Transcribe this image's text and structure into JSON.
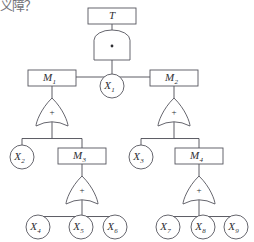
{
  "page": {
    "margin_text": "义障？",
    "background_color": "#ffffff",
    "line_color": "#55555d",
    "text_color": "#2e2e33"
  },
  "diagram": {
    "type": "fault-tree",
    "gate_symbols": {
      "and": "·",
      "or": "+"
    },
    "nodes": [
      {
        "id": "T",
        "kind": "box",
        "label": "T",
        "sub": "",
        "cx": 112,
        "cy": 16,
        "w": 48,
        "h": 16
      },
      {
        "id": "M1",
        "kind": "box",
        "label": "M",
        "sub": "1",
        "cx": 52,
        "cy": 78,
        "w": 48,
        "h": 16
      },
      {
        "id": "M2",
        "kind": "box",
        "label": "M",
        "sub": "2",
        "cx": 174,
        "cy": 78,
        "w": 48,
        "h": 16
      },
      {
        "id": "M3",
        "kind": "box",
        "label": "M",
        "sub": "3",
        "cx": 82,
        "cy": 156,
        "w": 48,
        "h": 16
      },
      {
        "id": "M4",
        "kind": "box",
        "label": "M",
        "sub": "4",
        "cx": 199,
        "cy": 156,
        "w": 48,
        "h": 16
      },
      {
        "id": "X1",
        "kind": "circle",
        "label": "X",
        "sub": "1",
        "cx": 112,
        "cy": 86,
        "r": 12
      },
      {
        "id": "X2",
        "kind": "circle",
        "label": "X",
        "sub": "2",
        "cx": 22,
        "cy": 157,
        "r": 12
      },
      {
        "id": "X3",
        "kind": "circle",
        "label": "X",
        "sub": "3",
        "cx": 141,
        "cy": 157,
        "r": 12
      },
      {
        "id": "X4",
        "kind": "circle",
        "label": "X",
        "sub": "4",
        "cx": 38,
        "cy": 227,
        "r": 12
      },
      {
        "id": "X5",
        "kind": "circle",
        "label": "X",
        "sub": "5",
        "cx": 81,
        "cy": 227,
        "r": 12
      },
      {
        "id": "X6",
        "kind": "circle",
        "label": "X",
        "sub": "6",
        "cx": 115,
        "cy": 227,
        "r": 12
      },
      {
        "id": "X7",
        "kind": "circle",
        "label": "X",
        "sub": "7",
        "cx": 168,
        "cy": 227,
        "r": 12
      },
      {
        "id": "X8",
        "kind": "circle",
        "label": "X",
        "sub": "8",
        "cx": 203,
        "cy": 227,
        "r": 12
      },
      {
        "id": "X9",
        "kind": "circle",
        "label": "X",
        "sub": "9",
        "cx": 236,
        "cy": 227,
        "r": 12
      }
    ],
    "gates": [
      {
        "id": "G0",
        "type": "and",
        "symbol": "·",
        "parent": "T",
        "cx": 112,
        "cy": 45,
        "children": [
          "M1",
          "X1",
          "M2"
        ]
      },
      {
        "id": "G1",
        "type": "or",
        "symbol": "+",
        "parent": "M1",
        "cx": 52,
        "cy": 112,
        "children": [
          "X2",
          "M3"
        ]
      },
      {
        "id": "G2",
        "type": "or",
        "symbol": "+",
        "parent": "M2",
        "cx": 174,
        "cy": 112,
        "children": [
          "X3",
          "M4"
        ]
      },
      {
        "id": "G3",
        "type": "or",
        "symbol": "+",
        "parent": "M3",
        "cx": 82,
        "cy": 190,
        "children": [
          "X4",
          "X5",
          "X6"
        ]
      },
      {
        "id": "G4",
        "type": "or",
        "symbol": "+",
        "parent": "M4",
        "cx": 199,
        "cy": 190,
        "children": [
          "X7",
          "X8",
          "X9"
        ]
      }
    ]
  }
}
